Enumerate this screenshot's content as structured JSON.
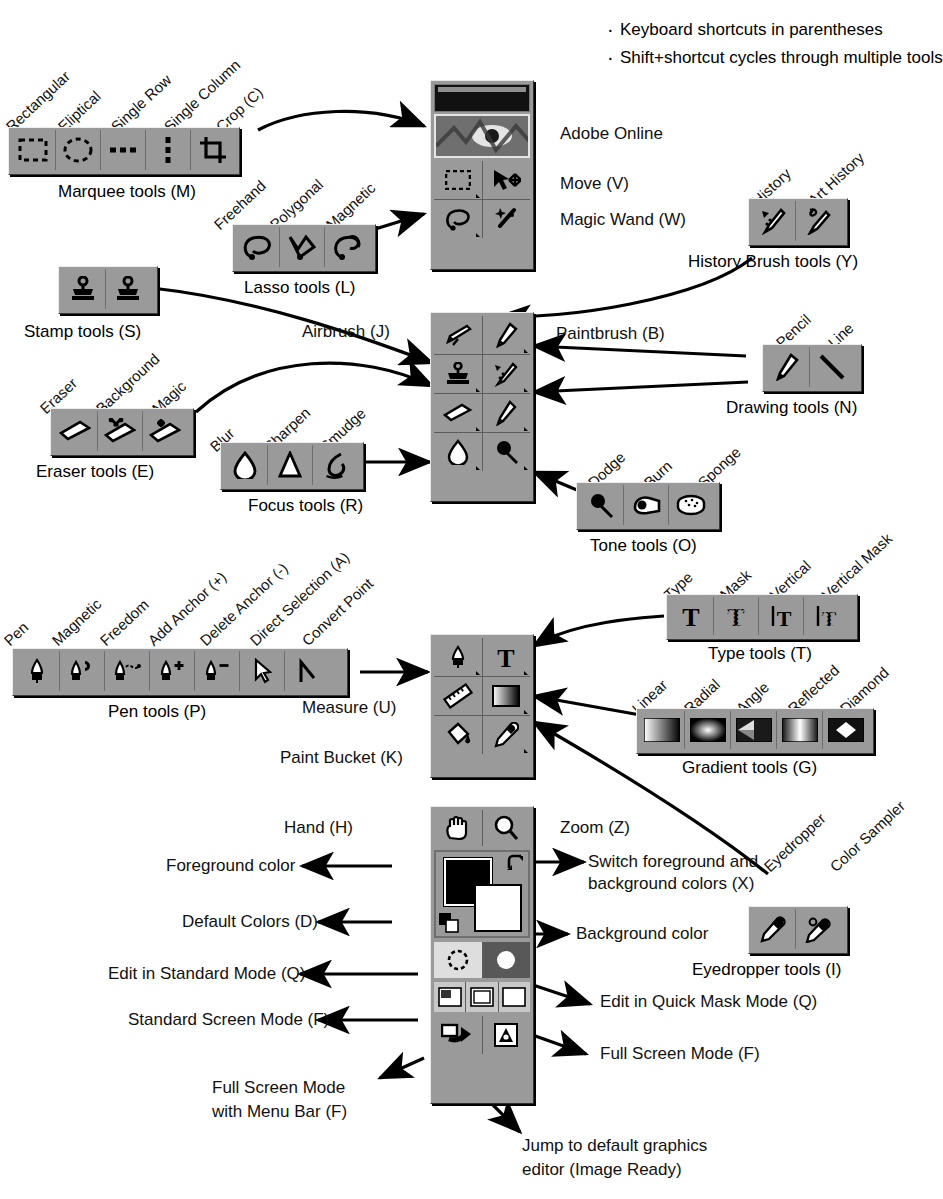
{
  "notes": [
    "Keyboard shortcuts in parentheses",
    "Shift+shortcut cycles through multiple tools"
  ],
  "groups": {
    "marquee": {
      "caption": "Marquee tools (M)",
      "items": [
        "Rectangular",
        "Eliptical",
        "Single Row",
        "Single Column",
        "Crop (C)"
      ]
    },
    "lasso": {
      "caption": "Lasso tools (L)",
      "items": [
        "Freehand",
        "Polygonal",
        "Magnetic"
      ]
    },
    "stamp": {
      "caption": "Stamp tools (S)",
      "items": [
        "Rubber Stamp",
        "Pattern Stamp"
      ]
    },
    "eraser": {
      "caption": "Eraser tools (E)",
      "items": [
        "Eraser",
        "Background",
        "Magic"
      ]
    },
    "focus": {
      "caption": "Focus tools (R)",
      "items": [
        "Blur",
        "Sharpen",
        "Smudge"
      ]
    },
    "history": {
      "caption": "History Brush tools (Y)",
      "items": [
        "History",
        "Art History"
      ]
    },
    "drawing": {
      "caption": "Drawing tools (N)",
      "items": [
        "Pencil",
        "Line"
      ]
    },
    "tone": {
      "caption": "Tone tools (O)",
      "items": [
        "Dodge",
        "Burn",
        "Sponge"
      ]
    },
    "pen": {
      "caption": "Pen tools (P)",
      "items": [
        "Pen",
        "Magnetic",
        "Freedom",
        "Add Anchor (+)",
        "Delete Anchor (-)",
        "Direct Selection (A)",
        "Convert Point"
      ]
    },
    "type": {
      "caption": "Type tools (T)",
      "items": [
        "Type",
        "Mask",
        "Vertical",
        "Vertical Mask"
      ]
    },
    "gradient": {
      "caption": "Gradient tools (G)",
      "items": [
        "Linear",
        "Radial",
        "Angle",
        "Reflected",
        "Diamond"
      ]
    },
    "eyedropper": {
      "caption": "Eyedropper tools (I)",
      "items": [
        "Eyedropper",
        "Color Sampler"
      ]
    }
  },
  "callouts": {
    "adobe_online": "Adobe Online",
    "move": "Move (V)",
    "magic_wand": "Magic Wand (W)",
    "airbrush": "Airbrush (J)",
    "paintbrush": "Paintbrush (B)",
    "measure": "Measure (U)",
    "paint_bucket": "Paint Bucket (K)",
    "hand": "Hand (H)",
    "zoom": "Zoom (Z)",
    "foreground_color": "Foreground color",
    "switch_colors_l1": "Switch foreground and",
    "switch_colors_l2": "background colors (X)",
    "default_colors": "Default Colors (D)",
    "background_color": "Background color",
    "edit_standard": "Edit in Standard Mode (Q)",
    "edit_quick_mask": "Edit in Quick Mask Mode (Q)",
    "standard_screen": "Standard Screen Mode (F)",
    "full_screen": "Full Screen Mode (F)",
    "full_screen_menu_l1": "Full Screen Mode",
    "full_screen_menu_l2": "with Menu Bar (F)",
    "jump_l1": "Jump to default graphics",
    "jump_l2": "editor (Image Ready)"
  },
  "colors": {
    "palette_face": "#9a9a9a",
    "palette_highlight": "#ededed",
    "palette_shadow": "#3a3a3a",
    "foreground_swatch": "#000000",
    "background_swatch": "#ffffff",
    "ink": "#111111"
  }
}
